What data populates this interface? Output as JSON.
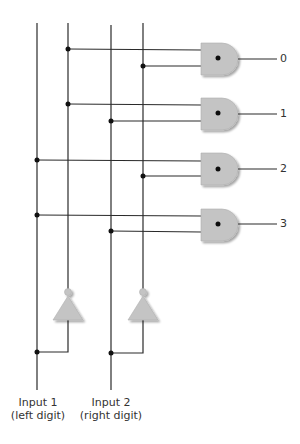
{
  "diagram": {
    "outputs": [
      {
        "label": "0",
        "inputs": [
          "NOT Input 1",
          "NOT Input 2"
        ]
      },
      {
        "label": "1",
        "inputs": [
          "NOT Input 1",
          "Input 2"
        ]
      },
      {
        "label": "2",
        "inputs": [
          "Input 1",
          "NOT Input 2"
        ]
      },
      {
        "label": "3",
        "inputs": [
          "Input 1",
          "Input 2"
        ]
      }
    ],
    "inputs": [
      {
        "line1": "Input 1",
        "line2": "(left digit)"
      },
      {
        "line1": "Input 2",
        "line2": "(right digit)"
      }
    ],
    "gate_type": "AND",
    "inverter_count": 2,
    "colors": {
      "wire": "#2a2a2a",
      "gate_fill": "#c4c4c4",
      "junction": "#111111"
    }
  }
}
